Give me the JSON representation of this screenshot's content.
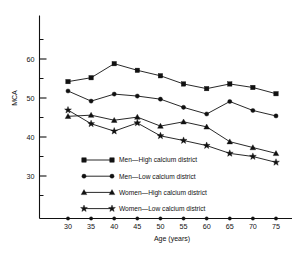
{
  "chart_data": {
    "type": "line",
    "title": "",
    "xlabel": "Age (years)",
    "ylabel": "MCA",
    "x": [
      30,
      35,
      40,
      45,
      50,
      55,
      60,
      65,
      70,
      75
    ],
    "xlim": [
      27,
      78
    ],
    "ylim": [
      24,
      67
    ],
    "grid": false,
    "legend_position": "inside-lower-left",
    "x_ticks": [
      "30",
      "35",
      "40",
      "45",
      "50",
      "55",
      "60",
      "65",
      "70",
      "75"
    ],
    "y_ticks_major": [
      "30",
      "40",
      "50",
      "60"
    ],
    "y_ticks_major_values": [
      30,
      40,
      50,
      60
    ],
    "y_ticks_minor_values": [
      25,
      35,
      45,
      55,
      65
    ],
    "series": [
      {
        "name": "Men—High calcium district",
        "marker": "square",
        "values": [
          54.2,
          55.2,
          58.8,
          57.1,
          55.7,
          53.6,
          52.4,
          53.6,
          52.7,
          51.1
        ]
      },
      {
        "name": "Men—Low calcium district",
        "marker": "circle",
        "values": [
          51.8,
          49.2,
          51.0,
          50.5,
          49.7,
          47.6,
          45.9,
          49.1,
          46.8,
          45.4
        ]
      },
      {
        "name": "Women—High calcium district",
        "marker": "triangle",
        "values": [
          45.3,
          45.6,
          44.3,
          45.1,
          42.8,
          43.9,
          42.6,
          38.8,
          37.3,
          35.8
        ]
      },
      {
        "name": "Women—Low calcium district",
        "marker": "star",
        "values": [
          46.9,
          43.4,
          41.5,
          43.6,
          40.3,
          39.1,
          37.8,
          35.8,
          35.0,
          33.5
        ]
      }
    ]
  },
  "legend": {
    "items": [
      {
        "label": "Men—High calcium district",
        "marker": "square"
      },
      {
        "label": "Men—Low calcium district",
        "marker": "circle"
      },
      {
        "label": "Women—High calcium district",
        "marker": "triangle"
      },
      {
        "label": "Women—Low calcium district",
        "marker": "star"
      }
    ]
  },
  "colors": {
    "ink": "#111111",
    "background": "#ffffff"
  }
}
